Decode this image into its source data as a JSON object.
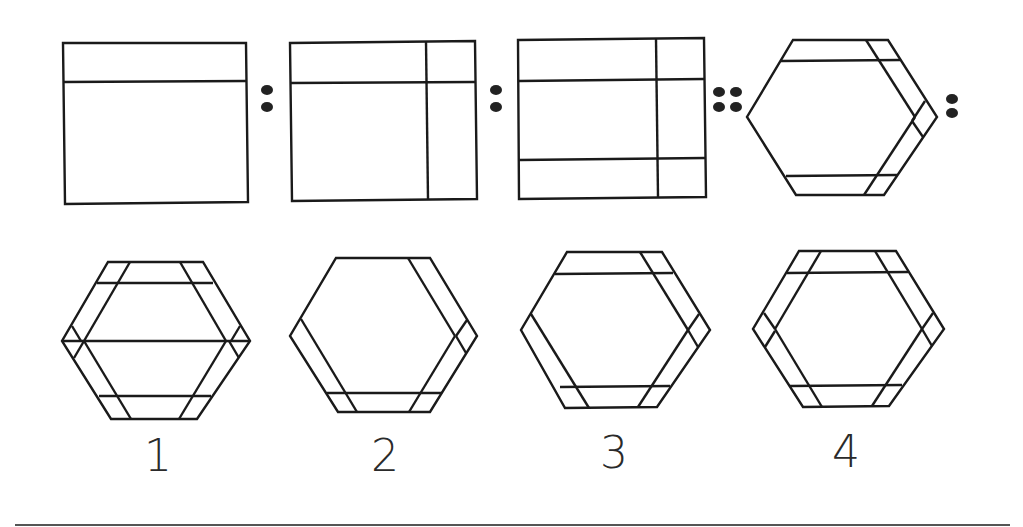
{
  "puzzle": {
    "type": "figure analogy",
    "statement": "Rectangle with 1 horizontal line : rectangle with 1 horizontal + 1 vertical line :: rectangle with 2 horizontal + 1 vertical lines : hexagon with strips",
    "separators": {
      "ratio": ":",
      "proportion": "::"
    },
    "question_figures": [
      {
        "id": "A",
        "shape": "rectangle",
        "lines": "1 horizontal"
      },
      {
        "id": "B",
        "shape": "rectangle",
        "lines": "1 horizontal, 1 vertical (right)"
      },
      {
        "id": "C",
        "shape": "rectangle",
        "lines": "2 horizontal, 1 vertical (right)"
      },
      {
        "id": "D",
        "shape": "hexagon",
        "lines": "top strip, bottom strip, right-side strips"
      }
    ],
    "options": [
      {
        "label": "1",
        "shape": "hexagon"
      },
      {
        "label": "2",
        "shape": "hexagon"
      },
      {
        "label": "3",
        "shape": "hexagon"
      },
      {
        "label": "4",
        "shape": "hexagon"
      }
    ]
  },
  "colors": {
    "stroke": "#1a1a1a",
    "background": "#ffffff"
  }
}
